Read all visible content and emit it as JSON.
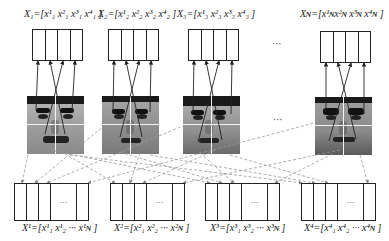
{
  "diagram": {
    "type": "feature-partition-regrouping",
    "top_vectors": [
      {
        "name": "X",
        "sub": "1",
        "elements": [
          "x1_1",
          "x2_1",
          "x3_1",
          "x4_1"
        ],
        "label_text": "X₁=[x¹₁ x²₁ x³₁ x⁴₁ ]"
      },
      {
        "name": "X",
        "sub": "2",
        "elements": [
          "x1_2",
          "x2_2",
          "x3_2",
          "x4_2"
        ],
        "label_text": "X₂=[x¹₂ x²₂ x³₂ x⁴₂ ]"
      },
      {
        "name": "X",
        "sub": "3",
        "elements": [
          "x1_3",
          "x2_3",
          "x3_3",
          "x4_3"
        ],
        "label_text": "X₃=[x¹₃ x²₃ x³₃ x⁴₃ ]"
      },
      {
        "name": "X",
        "sub": "N",
        "elements": [
          "x1_N",
          "x2_N",
          "x3_N",
          "x4_N"
        ],
        "label_text": "Xɴ=[x¹ɴx²ɴ x³ɴ x⁴ɴ ]"
      }
    ],
    "bottom_vectors": [
      {
        "name": "X",
        "sup": "1",
        "label_text": "X¹=[x¹₁ x¹₂ ··· x¹ɴ ]"
      },
      {
        "name": "X",
        "sup": "2",
        "label_text": "X²=[x²₁ x²₂ ··· x²ɴ ]"
      },
      {
        "name": "X",
        "sup": "3",
        "label_text": "X³=[x³₁ x³₂ ··· x³ɴ ]"
      },
      {
        "name": "X",
        "sup": "4",
        "label_text": "X⁴=[x⁴₁ x⁴₂ ··· x⁴ɴ ]"
      }
    ],
    "faces": [
      {
        "index": 1,
        "partition": "2x2 quadrants"
      },
      {
        "index": 2,
        "partition": "2x2 quadrants"
      },
      {
        "index": 3,
        "partition": "2x2 quadrants"
      },
      {
        "index": "N",
        "partition": "2x2 quadrants"
      }
    ],
    "ellipsis": "···",
    "box_ellipsis": "···",
    "colors": {
      "line": "#222222",
      "dashed_line": "#999999",
      "box_border": "#222222",
      "background": "#ffffff"
    }
  }
}
